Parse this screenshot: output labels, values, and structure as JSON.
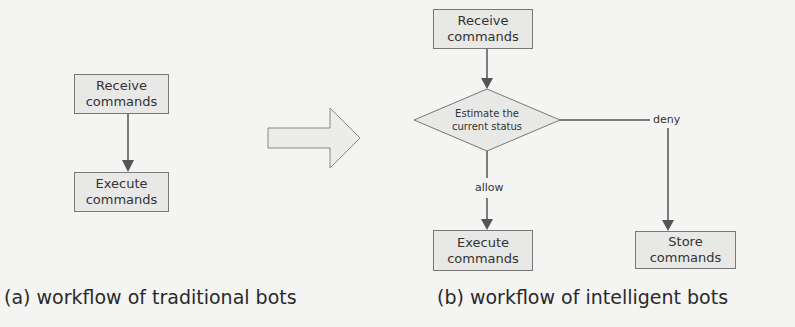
{
  "panel_a": {
    "nodes": [
      {
        "id": "receive",
        "line1": "Receive",
        "line2": "commands"
      },
      {
        "id": "execute",
        "line1": "Execute",
        "line2": "commands"
      }
    ],
    "caption": "(a) workflow of traditional bots"
  },
  "transition_arrow": {
    "icon": "right-block-arrow"
  },
  "panel_b": {
    "nodes": [
      {
        "id": "receive",
        "line1": "Receive",
        "line2": "commands"
      },
      {
        "id": "estimate",
        "line1": "Estimate the",
        "line2": "current status",
        "shape": "diamond"
      },
      {
        "id": "execute",
        "line1": "Execute",
        "line2": "commands"
      },
      {
        "id": "store",
        "line1": "Store",
        "line2": "commands"
      }
    ],
    "edges": [
      {
        "from": "receive",
        "to": "estimate",
        "label": ""
      },
      {
        "from": "estimate",
        "to": "execute",
        "label": "allow"
      },
      {
        "from": "estimate",
        "to": "store",
        "label": "deny"
      }
    ],
    "caption": "(b) workflow of intelligent bots"
  },
  "colors": {
    "box_fill": "#e8e8e6",
    "stroke": "#666666",
    "background": "#f4f4f2"
  }
}
